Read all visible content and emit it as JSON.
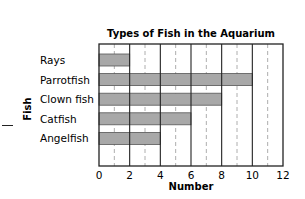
{
  "chart_data": {
    "type": "bar",
    "orientation": "horizontal",
    "title": "Types of Fish in the Aquarium",
    "xlabel": "Number",
    "ylabel": "Fish",
    "categories": [
      "Rays",
      "Parrotfish",
      "Clown fish",
      "Catfish",
      "Angelfish"
    ],
    "values": [
      2,
      10,
      8,
      6,
      4
    ],
    "xlim": [
      0,
      12
    ],
    "xticks": [
      "0",
      "2",
      "4",
      "6",
      "8",
      "10",
      "12"
    ],
    "grid": "vertical solid lines every 2, dashed lines at odd values",
    "colors": {
      "bar": "#a8a8a8",
      "bar_border": "#555555",
      "grid": "#222222",
      "minor_grid": "#999999"
    }
  }
}
